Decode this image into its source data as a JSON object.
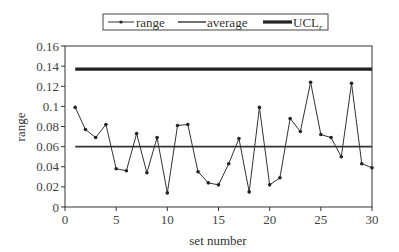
{
  "chart_data": {
    "type": "line",
    "title": "",
    "xlabel": "set number",
    "ylabel": "range",
    "xlim": [
      0,
      30
    ],
    "ylim": [
      0,
      0.16
    ],
    "xticks": [
      0,
      5,
      10,
      15,
      20,
      25,
      30
    ],
    "xtick_labels": [
      "0",
      "5",
      "10",
      "15",
      "20",
      "25",
      "30"
    ],
    "yticks": [
      0,
      0.02,
      0.04,
      0.06,
      0.08,
      0.1,
      0.12,
      0.14,
      0.16
    ],
    "ytick_labels": [
      "0",
      "0.02",
      "0.04",
      "0.06",
      "0.08",
      "0.1",
      "0.12",
      "0.14",
      "0.16"
    ],
    "grid": false,
    "legend_position": "top-center",
    "legend": [
      "range",
      "average",
      "UCL_r"
    ],
    "x": [
      1,
      2,
      3,
      4,
      5,
      6,
      7,
      8,
      9,
      10,
      11,
      12,
      13,
      14,
      15,
      16,
      17,
      18,
      19,
      20,
      21,
      22,
      23,
      24,
      25,
      26,
      27,
      28,
      29,
      30
    ],
    "series": [
      {
        "name": "range",
        "style": "line-with-markers",
        "color": "#333333",
        "values": [
          0.099,
          0.077,
          0.069,
          0.082,
          0.038,
          0.036,
          0.073,
          0.034,
          0.069,
          0.014,
          0.081,
          0.082,
          0.035,
          0.024,
          0.022,
          0.043,
          0.068,
          0.015,
          0.099,
          0.022,
          0.029,
          0.088,
          0.075,
          0.124,
          0.072,
          0.069,
          0.05,
          0.123,
          0.043,
          0.039
        ]
      },
      {
        "name": "average",
        "style": "line",
        "color": "#333333",
        "x_range": [
          1,
          30
        ],
        "value": 0.06
      },
      {
        "name": "UCL_r",
        "style": "thick-line",
        "color": "#222222",
        "x_range": [
          1,
          30
        ],
        "value": 0.137
      }
    ]
  },
  "legend": {
    "items": [
      {
        "label": "range"
      },
      {
        "label": "average"
      },
      {
        "label": "UCL",
        "subscript": "r"
      }
    ]
  },
  "axes": {
    "xlabel": "set number",
    "ylabel": "range"
  }
}
